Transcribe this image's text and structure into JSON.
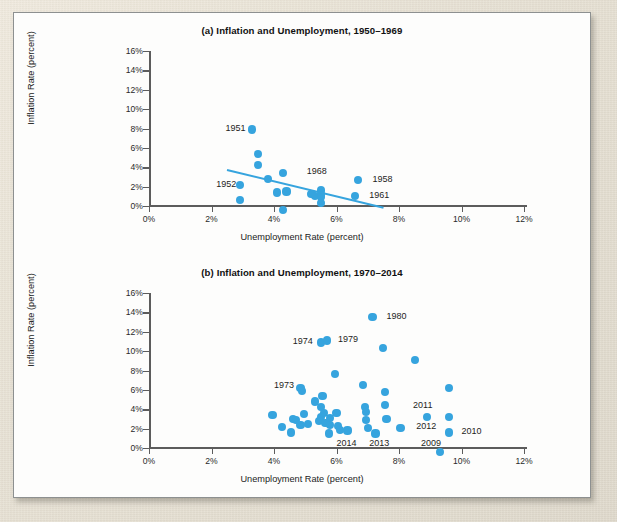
{
  "figure": {
    "axis_x_label": "Unemployment Rate (percent)",
    "axis_y_label": "Inflation Rate (percent)",
    "accent_color": "#36a4de",
    "axis_color": "#5c5c5c",
    "card_background": "#fdfdfc",
    "page_background": "#e8e3d8"
  },
  "chart_data": [
    {
      "id": "a",
      "type": "scatter",
      "title": "(a) Inflation and Unemployment, 1950–1969",
      "xlabel": "Unemployment Rate (percent)",
      "ylabel": "Inflation Rate (percent)",
      "xlim": [
        0,
        12
      ],
      "ylim": [
        0,
        16
      ],
      "xticks": [
        "0%",
        "2%",
        "4%",
        "6%",
        "8%",
        "10%",
        "12%"
      ],
      "xtick_values": [
        0,
        2,
        4,
        6,
        8,
        10,
        12
      ],
      "yticks": [
        "0%",
        "2%",
        "4%",
        "6%",
        "8%",
        "10%",
        "12%",
        "14%",
        "16%"
      ],
      "ytick_values": [
        0,
        2,
        4,
        6,
        8,
        10,
        12,
        14,
        16
      ],
      "grid": false,
      "legend": null,
      "trendline": {
        "x1": 2.5,
        "y1": 3.8,
        "x2": 7.5,
        "y2": -0.1
      },
      "points": [
        {
          "x": 2.9,
          "y": 2.2
        },
        {
          "x": 2.9,
          "y": 0.6
        },
        {
          "x": 3.3,
          "y": 7.9,
          "label": "1951"
        },
        {
          "x": 3.5,
          "y": 5.4
        },
        {
          "x": 3.5,
          "y": 4.2
        },
        {
          "x": 3.8,
          "y": 2.8
        },
        {
          "x": 4.1,
          "y": 1.4
        },
        {
          "x": 4.3,
          "y": 3.4
        },
        {
          "x": 4.4,
          "y": 1.5
        },
        {
          "x": 4.3,
          "y": -0.4
        },
        {
          "x": 5.2,
          "y": 1.2
        },
        {
          "x": 5.3,
          "y": 1.0
        },
        {
          "x": 5.5,
          "y": 1.6
        },
        {
          "x": 5.5,
          "y": 1.1
        },
        {
          "x": 5.5,
          "y": 0.9
        },
        {
          "x": 5.5,
          "y": 0.3
        },
        {
          "x": 6.7,
          "y": 2.7,
          "label": "1958"
        },
        {
          "x": 6.6,
          "y": 1.0,
          "label": "1961"
        }
      ],
      "annotations": [
        {
          "text": "1951",
          "x": 2.45,
          "y": 7.9
        },
        {
          "text": "1952",
          "x": 2.15,
          "y": 2.2
        },
        {
          "text": "1968",
          "x": 5.05,
          "y": 3.5
        },
        {
          "text": "1958",
          "x": 7.15,
          "y": 2.7
        },
        {
          "text": "1961",
          "x": 7.05,
          "y": 1.0
        }
      ]
    },
    {
      "id": "b",
      "type": "scatter",
      "title": "(b) Inflation and Unemployment, 1970–2014",
      "xlabel": "Unemployment Rate (percent)",
      "ylabel": "Inflation Rate (percent)",
      "xlim": [
        0,
        12
      ],
      "ylim": [
        0,
        16
      ],
      "xticks": [
        "0%",
        "2%",
        "4%",
        "6%",
        "8%",
        "10%",
        "12%"
      ],
      "xtick_values": [
        0,
        2,
        4,
        6,
        8,
        10,
        12
      ],
      "yticks": [
        "0%",
        "2%",
        "4%",
        "6%",
        "8%",
        "10%",
        "12%",
        "14%",
        "16%"
      ],
      "ytick_values": [
        0,
        2,
        4,
        6,
        8,
        10,
        12,
        14,
        16
      ],
      "grid": false,
      "legend": null,
      "trendline": null,
      "points": [
        {
          "x": 3.95,
          "y": 3.4
        },
        {
          "x": 4.25,
          "y": 2.2
        },
        {
          "x": 4.55,
          "y": 1.6
        },
        {
          "x": 4.6,
          "y": 3.0
        },
        {
          "x": 4.7,
          "y": 2.9
        },
        {
          "x": 4.85,
          "y": 6.2,
          "label": "1973"
        },
        {
          "x": 4.9,
          "y": 5.9
        },
        {
          "x": 4.85,
          "y": 2.4
        },
        {
          "x": 4.95,
          "y": 3.5
        },
        {
          "x": 5.1,
          "y": 2.5
        },
        {
          "x": 5.3,
          "y": 4.8
        },
        {
          "x": 5.5,
          "y": 10.9,
          "label": "1974"
        },
        {
          "x": 5.55,
          "y": 5.4
        },
        {
          "x": 5.5,
          "y": 4.2
        },
        {
          "x": 5.5,
          "y": 3.2
        },
        {
          "x": 5.45,
          "y": 2.8
        },
        {
          "x": 5.6,
          "y": 3.6
        },
        {
          "x": 5.65,
          "y": 2.6
        },
        {
          "x": 5.7,
          "y": 11.1,
          "label": "1979"
        },
        {
          "x": 5.8,
          "y": 3.1
        },
        {
          "x": 5.8,
          "y": 2.4
        },
        {
          "x": 5.75,
          "y": 1.5
        },
        {
          "x": 5.95,
          "y": 7.6
        },
        {
          "x": 6.0,
          "y": 3.6
        },
        {
          "x": 6.05,
          "y": 2.3
        },
        {
          "x": 6.1,
          "y": 1.9
        },
        {
          "x": 6.35,
          "y": 1.8
        },
        {
          "x": 6.85,
          "y": 6.5
        },
        {
          "x": 6.9,
          "y": 4.2
        },
        {
          "x": 6.95,
          "y": 3.7
        },
        {
          "x": 6.95,
          "y": 2.9
        },
        {
          "x": 7.0,
          "y": 2.1
        },
        {
          "x": 7.15,
          "y": 13.5,
          "label": "1980"
        },
        {
          "x": 7.25,
          "y": 1.5
        },
        {
          "x": 7.5,
          "y": 10.3
        },
        {
          "x": 7.55,
          "y": 5.8
        },
        {
          "x": 7.55,
          "y": 4.4
        },
        {
          "x": 7.6,
          "y": 3.0
        },
        {
          "x": 8.05,
          "y": 2.1
        },
        {
          "x": 8.5,
          "y": 9.1
        },
        {
          "x": 8.9,
          "y": 3.2
        },
        {
          "x": 9.3,
          "y": -0.4,
          "label": "2009"
        },
        {
          "x": 9.6,
          "y": 6.2
        },
        {
          "x": 9.6,
          "y": 3.2
        },
        {
          "x": 9.6,
          "y": 1.6,
          "label": "2010"
        }
      ],
      "annotations": [
        {
          "text": "1973",
          "x": 4.0,
          "y": 6.35
        },
        {
          "text": "1974",
          "x": 4.6,
          "y": 10.95
        },
        {
          "text": "1979",
          "x": 6.05,
          "y": 11.1
        },
        {
          "text": "1980",
          "x": 7.6,
          "y": 13.5
        },
        {
          "text": "2011",
          "x": 8.45,
          "y": 4.3
        },
        {
          "text": "2012",
          "x": 8.55,
          "y": 2.2
        },
        {
          "text": "2010",
          "x": 10.0,
          "y": 1.7
        },
        {
          "text": "2009",
          "x": 8.7,
          "y": 0.45
        },
        {
          "text": "2013",
          "x": 7.05,
          "y": 0.45
        },
        {
          "text": "2014",
          "x": 6.0,
          "y": 0.45
        }
      ]
    }
  ]
}
